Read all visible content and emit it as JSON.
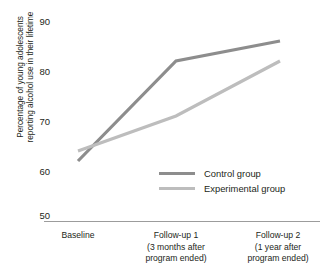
{
  "chart_data": {
    "type": "line",
    "title": "",
    "xlabel": "",
    "ylabel": "Percentage of young adolescents reporting alcohol use in their lifetime",
    "categories": [
      "Baseline",
      "Follow-up 1",
      "Follow-up 2"
    ],
    "category_sublabels": [
      [
        ""
      ],
      [
        "(3 months after",
        "program ended)"
      ],
      [
        "(1 year after",
        "program ended)"
      ]
    ],
    "series": [
      {
        "name": "Control group",
        "values": [
          62,
          82,
          86
        ],
        "color": "#8d8d8d"
      },
      {
        "name": "Experimental group",
        "values": [
          64,
          71,
          82
        ],
        "color": "#bdbdbd"
      }
    ],
    "ylim": [
      50,
      90
    ],
    "yticks": [
      50,
      60,
      70,
      80,
      90
    ],
    "ytick_labels": [
      "50",
      "60",
      "70",
      "80",
      "90"
    ],
    "grid": false,
    "legend_position": "inside-center-right"
  },
  "axis": {
    "y_title_line1": "Percentage of young adolescents",
    "y_title_line2": "reporting alcohol use in their lifetime",
    "y_tick_90": "90",
    "y_tick_80": "80",
    "y_tick_70": "70",
    "y_tick_60": "60",
    "y_tick_50": "50",
    "axis_color": "#9c9c9c"
  },
  "legend": {
    "control_label": "Control group",
    "experimental_label": "Experimental group",
    "control_color": "#8d8d8d",
    "experimental_color": "#bdbdbd"
  },
  "x_axis": {
    "cat1_line1": "Baseline",
    "cat2_line1": "Follow-up 1",
    "cat2_line2": "(3 months after",
    "cat2_line3": "program ended)",
    "cat3_line1": "Follow-up 2",
    "cat3_line2": "(1 year after",
    "cat3_line3": "program ended)"
  }
}
